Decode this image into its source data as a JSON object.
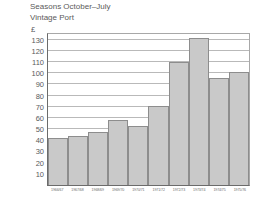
{
  "chart_data": {
    "type": "bar",
    "title": "Seasons October–July",
    "subtitle": "Vintage Port",
    "ylabel": "£",
    "xlabel": "",
    "ylim": [
      0,
      135
    ],
    "yticks": [
      10,
      20,
      30,
      40,
      50,
      60,
      70,
      80,
      90,
      100,
      110,
      120,
      130
    ],
    "grid": true,
    "legend": "none",
    "bar_color": "#c9c9c9",
    "bar_edge_color": "#8d8d8d",
    "categories": [
      "1966/67",
      "1967/68",
      "1968/69",
      "1969/70",
      "1970/71",
      "1971/72",
      "1972/73",
      "1973/74",
      "1974/75",
      "1975/76"
    ],
    "values": [
      42,
      44,
      47,
      58,
      53,
      71,
      110,
      131,
      96,
      101
    ]
  }
}
